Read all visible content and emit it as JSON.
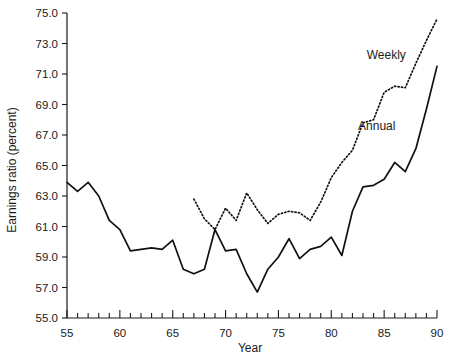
{
  "chart_data": {
    "type": "line",
    "title": "",
    "xlabel": "Year",
    "ylabel": "Earnings ratio (percent)",
    "xlim": [
      55,
      90
    ],
    "ylim": [
      55.0,
      75.0
    ],
    "grid": false,
    "legend_position": "inline-annotation",
    "y_ticks": [
      "55.0",
      "57.0",
      "59.0",
      "61.0",
      "63.0",
      "65.0",
      "67.0",
      "69.0",
      "71.0",
      "73.0",
      "75.0"
    ],
    "y_tick_values": [
      55.0,
      57.0,
      59.0,
      61.0,
      63.0,
      65.0,
      67.0,
      69.0,
      71.0,
      73.0,
      75.0
    ],
    "x_ticks": [
      "55",
      "60",
      "65",
      "70",
      "75",
      "80",
      "85",
      "90"
    ],
    "x_tick_values": [
      55,
      60,
      65,
      70,
      75,
      80,
      85,
      90
    ],
    "x_minor_step": 1,
    "series": [
      {
        "name": "Annual",
        "style": "solid",
        "label_text": "Annual",
        "x": [
          55,
          56,
          57,
          58,
          59,
          60,
          61,
          62,
          63,
          64,
          65,
          66,
          67,
          68,
          69,
          70,
          71,
          72,
          73,
          74,
          75,
          76,
          77,
          78,
          79,
          80,
          81,
          82,
          83,
          84,
          85,
          86,
          87,
          88,
          89,
          90
        ],
        "values": [
          63.9,
          63.3,
          63.9,
          63.0,
          61.4,
          60.8,
          59.4,
          59.5,
          59.6,
          59.5,
          60.1,
          58.2,
          57.9,
          58.2,
          60.8,
          59.4,
          59.5,
          57.9,
          56.7,
          58.2,
          59.0,
          60.2,
          58.9,
          59.5,
          59.7,
          60.3,
          59.1,
          62.0,
          63.6,
          63.7,
          64.1,
          65.2,
          64.6,
          66.1,
          68.7,
          71.5
        ]
      },
      {
        "name": "Weekly",
        "style": "dotted",
        "label_text": "Weekly",
        "x": [
          67,
          68,
          69,
          70,
          71,
          72,
          73,
          74,
          75,
          76,
          77,
          78,
          79,
          80,
          81,
          82,
          83,
          84,
          85,
          86,
          87,
          88,
          89,
          90
        ],
        "values": [
          62.8,
          61.5,
          60.8,
          62.2,
          61.4,
          63.2,
          62.1,
          61.2,
          61.8,
          62.0,
          61.9,
          61.4,
          62.6,
          64.2,
          65.2,
          66.0,
          67.8,
          68.0,
          69.8,
          70.2,
          70.1,
          71.7,
          73.2,
          74.6
        ]
      }
    ],
    "annotations": [
      {
        "text": "Weekly",
        "x": 85.2,
        "y": 72.0
      },
      {
        "text": "Annual",
        "x": 84.3,
        "y": 67.3
      }
    ]
  },
  "colors": {
    "background": "#ffffff",
    "ink": "#111111",
    "axis": "#1a1a1a"
  }
}
